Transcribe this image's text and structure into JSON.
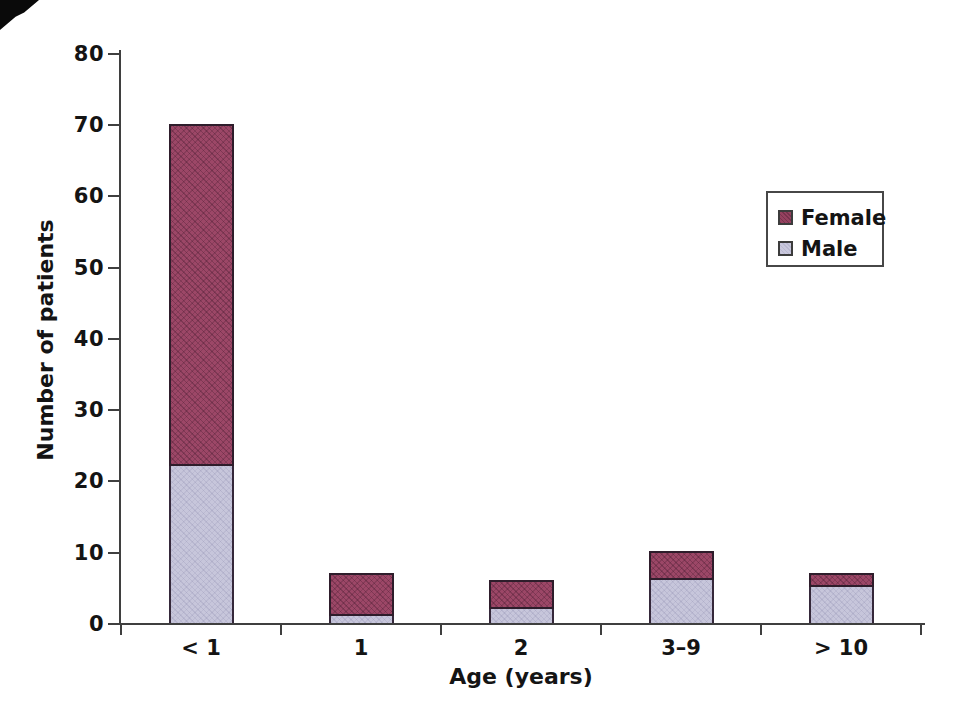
{
  "figure": {
    "background_color": "#ffffff",
    "scan_artifact": "black-page-corner-top-left",
    "text_color": "#141414",
    "axis_color": "#3f3f3f"
  },
  "chart_data": {
    "type": "bar",
    "stacked": true,
    "title": "",
    "xlabel": "Age (years)",
    "ylabel": "Number of patients",
    "categories": [
      "< 1",
      "1",
      "2",
      "3–9",
      "> 10"
    ],
    "series": [
      {
        "name": "Male",
        "color": "#c7c6db",
        "values": [
          22,
          1,
          2,
          6,
          5
        ]
      },
      {
        "name": "Female",
        "color": "#9c4767",
        "values": [
          48,
          6,
          4,
          4,
          2
        ]
      }
    ],
    "totals": [
      70,
      7,
      6,
      10,
      7
    ],
    "ylim": [
      0,
      80
    ],
    "yticks": [
      0,
      10,
      20,
      30,
      40,
      50,
      60,
      70,
      80
    ],
    "grid": false,
    "legend_position": "upper-right",
    "bar_outline_color": "#2e1d2b"
  },
  "legend": {
    "items": [
      {
        "label": "Female",
        "swatch": "female"
      },
      {
        "label": "Male",
        "swatch": "male"
      }
    ]
  }
}
